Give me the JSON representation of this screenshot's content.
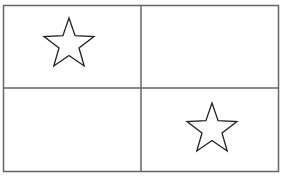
{
  "figure": {
    "background_color": "#ffffff",
    "stroke_color": "#555555",
    "star_stroke_color": "#222222",
    "quadrants": [
      {
        "position": "top-left",
        "content": "star"
      },
      {
        "position": "top-right",
        "content": "empty"
      },
      {
        "position": "bottom-left",
        "content": "empty"
      },
      {
        "position": "bottom-right",
        "content": "star"
      }
    ]
  }
}
